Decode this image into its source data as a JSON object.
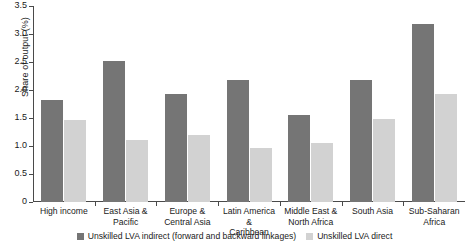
{
  "chart_data": {
    "type": "bar",
    "title": "",
    "xlabel": "",
    "ylabel": "Share of output (%)",
    "ylim": [
      0,
      3.5
    ],
    "ytick_labels": [
      "3.5",
      "3.0",
      "2.5",
      "2.0",
      "1.5",
      "1.0",
      "0.5",
      "0"
    ],
    "ytick_values": [
      3.5,
      3.0,
      2.5,
      2.0,
      1.5,
      1.0,
      0.5,
      0
    ],
    "grid": false,
    "legend_position": "bottom",
    "categories": [
      "High income",
      "East Asia & Pacific",
      "Europe & Central Asia",
      "Latin America & Caribbean",
      "Middle East & North Africa",
      "South Asia",
      "Sub-Saharan Africa"
    ],
    "category_lines": [
      [
        "High income"
      ],
      [
        "East Asia &",
        "Pacific"
      ],
      [
        "Europe &",
        "Central Asia"
      ],
      [
        "Latin America &",
        "Caribbean"
      ],
      [
        "Middle East &",
        "North Africa"
      ],
      [
        "South Asia"
      ],
      [
        "Sub-Saharan",
        "Africa"
      ]
    ],
    "series": [
      {
        "name": "Unskilled LVA indirect (forward and backward linkages)",
        "color": "#757575",
        "values": [
          1.82,
          2.52,
          1.92,
          2.18,
          1.55,
          2.18,
          3.18
        ]
      },
      {
        "name": "Unskilled LVA direct",
        "color": "#d2d2d2",
        "values": [
          1.46,
          1.1,
          1.19,
          0.96,
          1.05,
          1.49,
          1.92
        ]
      }
    ]
  },
  "legend": {
    "items": [
      {
        "label": "Unskilled LVA indirect (forward and backward linkages)"
      },
      {
        "label": "Unskilled LVA direct"
      }
    ]
  }
}
